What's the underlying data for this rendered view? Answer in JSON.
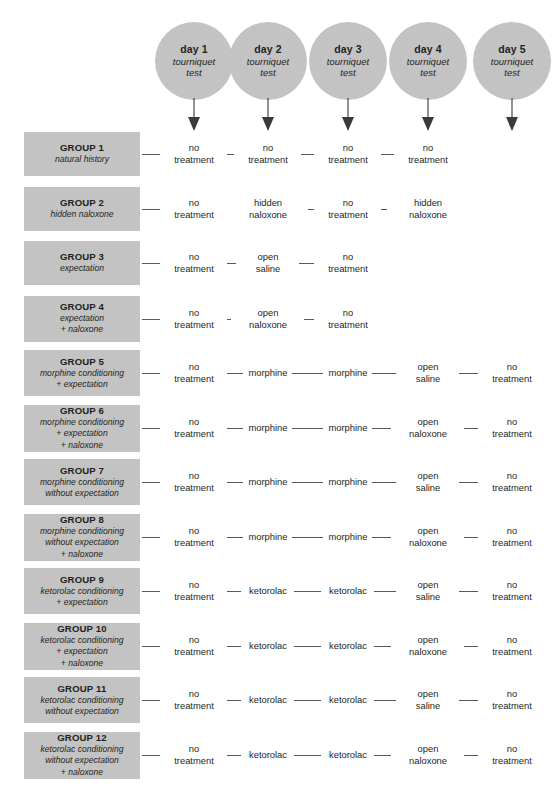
{
  "columns": [
    {
      "day": "day 1",
      "test_line1": "tourniquet",
      "test_line2": "test"
    },
    {
      "day": "day 2",
      "test_line1": "tourniquet",
      "test_line2": "test"
    },
    {
      "day": "day 3",
      "test_line1": "tourniquet",
      "test_line2": "test"
    },
    {
      "day": "day 4",
      "test_line1": "tourniquet",
      "test_line2": "test"
    },
    {
      "day": "day 5",
      "test_line1": "tourniquet",
      "test_line2": "test"
    }
  ],
  "groups": [
    {
      "title": "GROUP 1",
      "sub": [
        "natural history"
      ],
      "cells": [
        {
          "line1": "no",
          "line2": "treatment"
        },
        {
          "line1": "no",
          "line2": "treatment"
        },
        {
          "line1": "no",
          "line2": "treatment"
        },
        {
          "line1": "no",
          "line2": "treatment"
        },
        null
      ]
    },
    {
      "title": "GROUP 2",
      "sub": [
        "hidden naloxone"
      ],
      "cells": [
        {
          "line1": "no",
          "line2": "treatment"
        },
        {
          "line1": "hidden",
          "line2": "naloxone"
        },
        {
          "line1": "no",
          "line2": "treatment"
        },
        {
          "line1": "hidden",
          "line2": "naloxone"
        },
        null
      ]
    },
    {
      "title": "GROUP 3",
      "sub": [
        "expectation"
      ],
      "cells": [
        {
          "line1": "no",
          "line2": "treatment"
        },
        {
          "line1": "open",
          "line2": "saline"
        },
        {
          "line1": "no",
          "line2": "treatment"
        },
        null,
        null
      ]
    },
    {
      "title": "GROUP 4",
      "sub": [
        "expectation",
        "+ naloxone"
      ],
      "cells": [
        {
          "line1": "no",
          "line2": "treatment"
        },
        {
          "line1": "open",
          "line2": "naloxone"
        },
        {
          "line1": "no",
          "line2": "treatment"
        },
        null,
        null
      ]
    },
    {
      "title": "GROUP 5",
      "sub": [
        "morphine conditioning",
        "+ expectation"
      ],
      "cells": [
        {
          "line1": "no",
          "line2": "treatment"
        },
        {
          "line1": "morphine",
          "line2": ""
        },
        {
          "line1": "morphine",
          "line2": ""
        },
        {
          "line1": "open",
          "line2": "saline"
        },
        {
          "line1": "no",
          "line2": "treatment"
        }
      ]
    },
    {
      "title": "GROUP 6",
      "sub": [
        "morphine conditioning",
        "+ expectation",
        "+ naloxone"
      ],
      "cells": [
        {
          "line1": "no",
          "line2": "treatment"
        },
        {
          "line1": "morphine",
          "line2": ""
        },
        {
          "line1": "morphine",
          "line2": ""
        },
        {
          "line1": "open",
          "line2": "naloxone"
        },
        {
          "line1": "no",
          "line2": "treatment"
        }
      ]
    },
    {
      "title": "GROUP 7",
      "sub": [
        "morphine conditioning",
        "without expectation"
      ],
      "cells": [
        {
          "line1": "no",
          "line2": "treatment"
        },
        {
          "line1": "morphine",
          "line2": ""
        },
        {
          "line1": "morphine",
          "line2": ""
        },
        {
          "line1": "open",
          "line2": "saline"
        },
        {
          "line1": "no",
          "line2": "treatment"
        }
      ]
    },
    {
      "title": "GROUP 8",
      "sub": [
        "morphine conditioning",
        "without expectation",
        "+ naloxone"
      ],
      "cells": [
        {
          "line1": "no",
          "line2": "treatment"
        },
        {
          "line1": "morphine",
          "line2": ""
        },
        {
          "line1": "morphine",
          "line2": ""
        },
        {
          "line1": "open",
          "line2": "naloxone"
        },
        {
          "line1": "no",
          "line2": "treatment"
        }
      ]
    },
    {
      "title": "GROUP 9",
      "sub": [
        "ketorolac conditioning",
        "+ expectation"
      ],
      "cells": [
        {
          "line1": "no",
          "line2": "treatment"
        },
        {
          "line1": "ketorolac",
          "line2": ""
        },
        {
          "line1": "ketorolac",
          "line2": ""
        },
        {
          "line1": "open",
          "line2": "saline"
        },
        {
          "line1": "no",
          "line2": "treatment"
        }
      ]
    },
    {
      "title": "GROUP 10",
      "sub": [
        "ketorolac conditioning",
        "+ expectation",
        "+ naloxone"
      ],
      "cells": [
        {
          "line1": "no",
          "line2": "treatment"
        },
        {
          "line1": "ketorolac",
          "line2": ""
        },
        {
          "line1": "ketorolac",
          "line2": ""
        },
        {
          "line1": "open",
          "line2": "naloxone"
        },
        {
          "line1": "no",
          "line2": "treatment"
        }
      ]
    },
    {
      "title": "GROUP 11",
      "sub": [
        "ketorolac conditioning",
        "without expectation"
      ],
      "cells": [
        {
          "line1": "no",
          "line2": "treatment"
        },
        {
          "line1": "ketorolac",
          "line2": ""
        },
        {
          "line1": "ketorolac",
          "line2": ""
        },
        {
          "line1": "open",
          "line2": "saline"
        },
        {
          "line1": "no",
          "line2": "treatment"
        }
      ]
    },
    {
      "title": "GROUP 12",
      "sub": [
        "ketorolac conditioning",
        "without expectation",
        "+ naloxone"
      ],
      "cells": [
        {
          "line1": "no",
          "line2": "treatment"
        },
        {
          "line1": "ketorolac",
          "line2": ""
        },
        {
          "line1": "ketorolac",
          "line2": ""
        },
        {
          "line1": "open",
          "line2": "naloxone"
        },
        {
          "line1": "no",
          "line2": "treatment"
        }
      ]
    }
  ],
  "caption": {
    "text": ""
  },
  "colors": {
    "box_fill": "#c3c3c3",
    "circle_fill": "#c3c3c3",
    "text": "#231f20",
    "connector": "#58585a",
    "arrow": "#3a3a3c"
  },
  "layout": {
    "column_centers": [
      194,
      268,
      348,
      428,
      512
    ],
    "circle_diameter": 78,
    "row_top_first": 132,
    "row_pitch": 54.5
  }
}
